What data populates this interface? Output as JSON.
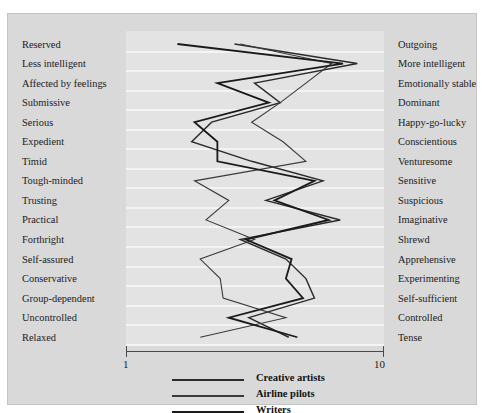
{
  "figure": {
    "caption_fragment": "",
    "background_color": "#d9d9d9",
    "plot_background_color": "#e3e3e3",
    "gridline_color": "#f4f4f4"
  },
  "axis": {
    "min_label": "1",
    "max_label": "10",
    "min_value": 1,
    "max_value": 10
  },
  "legend": {
    "position": "bottom-center",
    "entries": [
      {
        "label": "Creative artists",
        "color": "#2b2b2b",
        "width": 1.4
      },
      {
        "label": "Airline pilots",
        "color": "#3a3a3a",
        "width": 1.1
      },
      {
        "label": "Writers",
        "color": "#1a1a1a",
        "width": 1.8
      }
    ]
  },
  "chart_data": {
    "type": "line",
    "orientation": "horizontal-profile",
    "title": "",
    "subtitle": "",
    "xlabel": "",
    "ylabel": "",
    "xlim": [
      1,
      10
    ],
    "grid": true,
    "legend_position": "bottom-center",
    "categories": [
      "Reserved / Outgoing",
      "Less intelligent / More intelligent",
      "Affected by feelings / Emotionally stable",
      "Submissive / Dominant",
      "Serious / Happy-go-lucky",
      "Expedient / Conscientious",
      "Timid / Venturesome",
      "Tough-minded / Sensitive",
      "Trusting / Suspicious",
      "Practical / Imaginative",
      "Forthright / Shrewd",
      "Self-assured / Apprehensive",
      "Conservative / Experimenting",
      "Group-dependent / Self-sufficient",
      "Uncontrolled / Controlled",
      "Relaxed / Tense"
    ],
    "left_poles": [
      "Reserved",
      "Less intelligent",
      "Affected by feelings",
      "Submissive",
      "Serious",
      "Expedient",
      "Timid",
      "Tough-minded",
      "Trusting",
      "Practical",
      "Forthright",
      "Self-assured",
      "Conservative",
      "Group-dependent",
      "Uncontrolled",
      "Relaxed"
    ],
    "right_poles": [
      "Outgoing",
      "More intelligent",
      "Emotionally stable",
      "Dominant",
      "Happy-go-lucky",
      "Conscientious",
      "Venturesome",
      "Sensitive",
      "Suspicious",
      "Imaginative",
      "Shrewd",
      "Apprehensive",
      "Experimenting",
      "Self-sufficient",
      "Controlled",
      "Tense"
    ],
    "series": [
      {
        "name": "Creative artists",
        "color": "#2b2b2b",
        "values": [
          4.8,
          9.1,
          5.5,
          6.4,
          4.0,
          3.3,
          5.4,
          7.9,
          5.9,
          8.5,
          5.0,
          6.6,
          7.3,
          7.6,
          5.3,
          6.7
        ]
      },
      {
        "name": "Airline pilots",
        "color": "#3a3a3a",
        "values": [
          5.0,
          8.2,
          7.3,
          6.4,
          5.4,
          6.5,
          7.3,
          3.4,
          4.6,
          3.8,
          5.5,
          3.6,
          4.3,
          4.4,
          6.6,
          3.6
        ]
      },
      {
        "name": "Writers",
        "color": "#1a1a1a",
        "values": [
          2.8,
          8.6,
          4.2,
          6.0,
          3.4,
          4.2,
          4.2,
          7.6,
          6.2,
          8.1,
          5.2,
          6.8,
          6.6,
          7.2,
          4.6,
          7.0
        ]
      }
    ]
  }
}
